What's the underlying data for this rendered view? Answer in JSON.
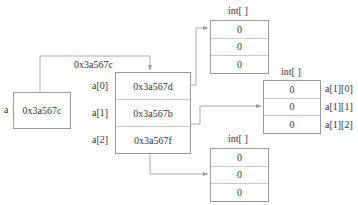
{
  "variable": {
    "name": "a",
    "value": "0x3a567c"
  },
  "outer_array": {
    "address_label": "0x3a567c",
    "rows": [
      {
        "label": "a[0]",
        "value": "0x3a567d"
      },
      {
        "label": "a[1]",
        "value": "0x3a567b"
      },
      {
        "label": "a[2]",
        "value": "0x3a567f"
      }
    ]
  },
  "inner_arrays": [
    {
      "type_label": "int[ ]",
      "values": [
        "0",
        "0",
        "0"
      ]
    },
    {
      "type_label": "int[ ]",
      "values": [
        "0",
        "0",
        "0"
      ],
      "element_labels": [
        "a[1][0]",
        "a[1][1]",
        "a[1][2]"
      ]
    },
    {
      "type_label": "int[ ]",
      "values": [
        "0",
        "0",
        "0"
      ]
    }
  ]
}
